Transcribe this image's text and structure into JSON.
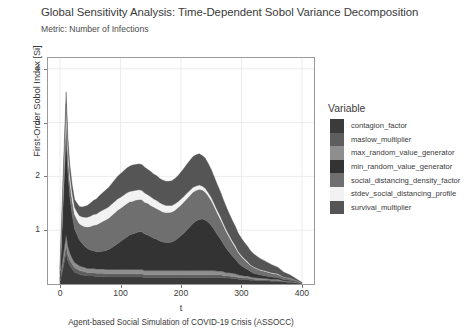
{
  "chart_data": {
    "type": "area",
    "title": "Global Sensitivity Analysis: Time-Dependent Sobol Variance Decomposition",
    "subtitle": "Metric: Number of Infections",
    "xlabel": "t",
    "ylabel": "First-Order Sobol Index [Si]",
    "caption": "Agent-based Social Simulation of COVID-19 Crisis (ASSOCC)",
    "stacked": true,
    "grid": true,
    "legend_position": "right",
    "legend_title": "Variable",
    "xlim": [
      -20,
      420
    ],
    "ylim": [
      0,
      4.2
    ],
    "xticks": [
      0,
      100,
      200,
      300,
      400
    ],
    "yticks": [
      1,
      2,
      3,
      4
    ],
    "x": [
      0,
      5,
      10,
      13,
      16,
      20,
      24,
      28,
      32,
      36,
      40,
      45,
      50,
      55,
      60,
      65,
      70,
      75,
      80,
      85,
      90,
      95,
      100,
      105,
      110,
      115,
      120,
      125,
      130,
      135,
      140,
      145,
      150,
      155,
      160,
      165,
      170,
      175,
      180,
      185,
      190,
      195,
      200,
      205,
      210,
      215,
      220,
      225,
      230,
      235,
      240,
      245,
      250,
      255,
      260,
      265,
      270,
      275,
      280,
      285,
      290,
      295,
      300,
      305,
      310,
      315,
      320,
      330,
      340,
      350,
      360,
      370,
      380,
      390,
      400
    ],
    "series": [
      {
        "name": "contagion_factor",
        "color": "#3b3b3b",
        "values": [
          0.05,
          0.3,
          0.58,
          0.42,
          0.35,
          0.28,
          0.22,
          0.2,
          0.18,
          0.17,
          0.16,
          0.15,
          0.15,
          0.15,
          0.14,
          0.14,
          0.14,
          0.13,
          0.13,
          0.13,
          0.13,
          0.13,
          0.13,
          0.13,
          0.13,
          0.13,
          0.13,
          0.13,
          0.13,
          0.13,
          0.12,
          0.12,
          0.12,
          0.12,
          0.12,
          0.12,
          0.12,
          0.12,
          0.12,
          0.12,
          0.12,
          0.12,
          0.12,
          0.12,
          0.12,
          0.12,
          0.12,
          0.12,
          0.12,
          0.12,
          0.12,
          0.12,
          0.12,
          0.12,
          0.12,
          0.12,
          0.12,
          0.11,
          0.11,
          0.1,
          0.1,
          0.09,
          0.09,
          0.08,
          0.08,
          0.07,
          0.07,
          0.06,
          0.06,
          0.05,
          0.05,
          0.04,
          0.03,
          0.02,
          0.01
        ]
      },
      {
        "name": "maslow_multiplier",
        "color": "#5e5e5e",
        "values": [
          0.02,
          0.1,
          0.14,
          0.12,
          0.1,
          0.09,
          0.08,
          0.08,
          0.07,
          0.07,
          0.07,
          0.06,
          0.06,
          0.06,
          0.06,
          0.06,
          0.06,
          0.06,
          0.06,
          0.06,
          0.06,
          0.06,
          0.06,
          0.06,
          0.06,
          0.06,
          0.06,
          0.06,
          0.06,
          0.06,
          0.05,
          0.05,
          0.05,
          0.05,
          0.05,
          0.05,
          0.05,
          0.05,
          0.05,
          0.05,
          0.05,
          0.05,
          0.05,
          0.05,
          0.05,
          0.05,
          0.05,
          0.05,
          0.05,
          0.05,
          0.05,
          0.05,
          0.05,
          0.05,
          0.05,
          0.05,
          0.04,
          0.04,
          0.04,
          0.04,
          0.04,
          0.03,
          0.03,
          0.03,
          0.03,
          0.03,
          0.02,
          0.02,
          0.02,
          0.02,
          0.02,
          0.01,
          0.01,
          0.01,
          0.0
        ]
      },
      {
        "name": "max_random_value_generator",
        "color": "#8e8e8e",
        "values": [
          0.02,
          0.12,
          0.2,
          0.16,
          0.13,
          0.11,
          0.1,
          0.09,
          0.09,
          0.08,
          0.08,
          0.08,
          0.08,
          0.08,
          0.08,
          0.08,
          0.08,
          0.08,
          0.08,
          0.08,
          0.08,
          0.08,
          0.08,
          0.08,
          0.08,
          0.08,
          0.08,
          0.08,
          0.08,
          0.08,
          0.08,
          0.08,
          0.08,
          0.08,
          0.08,
          0.08,
          0.08,
          0.08,
          0.08,
          0.08,
          0.08,
          0.08,
          0.08,
          0.08,
          0.08,
          0.08,
          0.08,
          0.08,
          0.08,
          0.08,
          0.08,
          0.08,
          0.08,
          0.08,
          0.07,
          0.07,
          0.07,
          0.06,
          0.06,
          0.06,
          0.05,
          0.05,
          0.04,
          0.04,
          0.04,
          0.03,
          0.03,
          0.03,
          0.02,
          0.02,
          0.02,
          0.01,
          0.01,
          0.01,
          0.0
        ]
      },
      {
        "name": "min_random_value_generator",
        "color": "#333333",
        "values": [
          0.1,
          0.95,
          1.85,
          1.35,
          1.05,
          0.8,
          0.62,
          0.55,
          0.48,
          0.44,
          0.4,
          0.37,
          0.34,
          0.33,
          0.32,
          0.32,
          0.33,
          0.35,
          0.37,
          0.4,
          0.44,
          0.48,
          0.52,
          0.56,
          0.6,
          0.64,
          0.66,
          0.68,
          0.7,
          0.7,
          0.68,
          0.66,
          0.63,
          0.6,
          0.58,
          0.55,
          0.53,
          0.52,
          0.52,
          0.53,
          0.56,
          0.6,
          0.65,
          0.7,
          0.76,
          0.82,
          0.88,
          0.92,
          0.95,
          0.96,
          0.94,
          0.9,
          0.84,
          0.76,
          0.68,
          0.6,
          0.52,
          0.45,
          0.38,
          0.32,
          0.27,
          0.22,
          0.18,
          0.15,
          0.12,
          0.1,
          0.08,
          0.06,
          0.05,
          0.04,
          0.03,
          0.02,
          0.02,
          0.01,
          0.0
        ]
      },
      {
        "name": "social_distancing_density_factor",
        "color": "#6f6f6f",
        "values": [
          0.06,
          0.28,
          0.42,
          0.34,
          0.3,
          0.28,
          0.27,
          0.28,
          0.3,
          0.33,
          0.36,
          0.4,
          0.44,
          0.47,
          0.5,
          0.53,
          0.55,
          0.57,
          0.58,
          0.6,
          0.61,
          0.62,
          0.62,
          0.62,
          0.62,
          0.62,
          0.61,
          0.61,
          0.6,
          0.6,
          0.59,
          0.59,
          0.58,
          0.58,
          0.57,
          0.57,
          0.56,
          0.56,
          0.56,
          0.56,
          0.56,
          0.57,
          0.57,
          0.58,
          0.58,
          0.58,
          0.58,
          0.57,
          0.56,
          0.54,
          0.52,
          0.49,
          0.46,
          0.43,
          0.4,
          0.37,
          0.34,
          0.31,
          0.28,
          0.25,
          0.22,
          0.19,
          0.17,
          0.15,
          0.13,
          0.12,
          0.11,
          0.09,
          0.08,
          0.07,
          0.06,
          0.05,
          0.04,
          0.02,
          0.01
        ]
      },
      {
        "name": "stdev_social_distancing_profile",
        "color": "#f2f2f2",
        "values": [
          0.02,
          0.1,
          0.16,
          0.14,
          0.13,
          0.13,
          0.13,
          0.14,
          0.15,
          0.16,
          0.17,
          0.18,
          0.19,
          0.2,
          0.2,
          0.21,
          0.21,
          0.21,
          0.21,
          0.21,
          0.21,
          0.21,
          0.2,
          0.2,
          0.2,
          0.19,
          0.19,
          0.18,
          0.18,
          0.17,
          0.17,
          0.16,
          0.16,
          0.15,
          0.15,
          0.14,
          0.14,
          0.13,
          0.13,
          0.12,
          0.12,
          0.11,
          0.11,
          0.1,
          0.1,
          0.09,
          0.09,
          0.08,
          0.08,
          0.07,
          0.07,
          0.06,
          0.06,
          0.05,
          0.05,
          0.05,
          0.04,
          0.04,
          0.03,
          0.03,
          0.03,
          0.02,
          0.02,
          0.02,
          0.02,
          0.01,
          0.01,
          0.01,
          0.01,
          0.01,
          0.01,
          0.0,
          0.0,
          0.0,
          0.0
        ]
      },
      {
        "name": "survival_multiplier",
        "color": "#555555",
        "values": [
          0.03,
          0.15,
          0.22,
          0.18,
          0.16,
          0.15,
          0.15,
          0.16,
          0.17,
          0.18,
          0.2,
          0.22,
          0.24,
          0.26,
          0.28,
          0.3,
          0.32,
          0.34,
          0.36,
          0.38,
          0.4,
          0.42,
          0.44,
          0.45,
          0.46,
          0.47,
          0.48,
          0.48,
          0.48,
          0.48,
          0.48,
          0.47,
          0.47,
          0.46,
          0.46,
          0.45,
          0.45,
          0.45,
          0.45,
          0.46,
          0.47,
          0.48,
          0.5,
          0.52,
          0.54,
          0.56,
          0.57,
          0.58,
          0.58,
          0.57,
          0.56,
          0.54,
          0.52,
          0.5,
          0.48,
          0.46,
          0.44,
          0.42,
          0.4,
          0.38,
          0.36,
          0.34,
          0.32,
          0.3,
          0.28,
          0.26,
          0.24,
          0.21,
          0.18,
          0.15,
          0.12,
          0.09,
          0.06,
          0.03,
          0.01
        ]
      }
    ]
  }
}
